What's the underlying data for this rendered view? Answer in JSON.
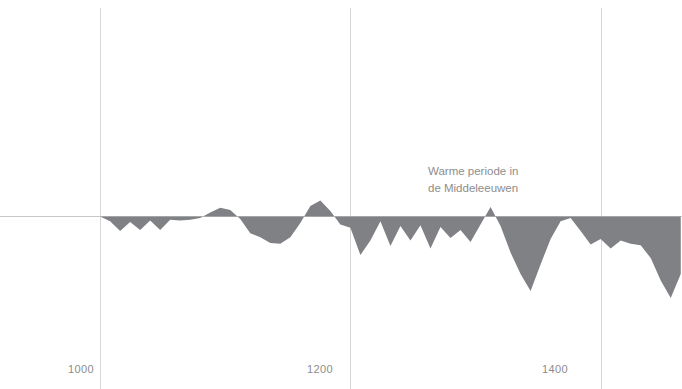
{
  "chart_data": {
    "type": "area",
    "title": "",
    "subtitle": "",
    "xlabel": "",
    "ylabel": "",
    "xlim": [
      920,
      1465
    ],
    "ylim": [
      -1.05,
      0.45
    ],
    "grid": true,
    "legend_position": "none",
    "zero_line": 0,
    "annotations": [
      {
        "id": "warm-period",
        "lines": [
          "Warme periode in",
          "de Middeleeuwen"
        ],
        "x": 1310,
        "y": 0.32
      }
    ],
    "xticks": [
      1000,
      1200,
      1400
    ],
    "xtick_labels": [
      "1000",
      "1200",
      "1400"
    ],
    "yticks": [],
    "ytick_labels": [],
    "series": [
      {
        "name": "Temperatuurafwijking",
        "fill_color": "#7f8184",
        "x": [
          1000,
          1008,
          1016,
          1024,
          1032,
          1040,
          1048,
          1056,
          1064,
          1072,
          1080,
          1088,
          1096,
          1104,
          1112,
          1120,
          1128,
          1136,
          1144,
          1152,
          1160,
          1168,
          1176,
          1184,
          1192,
          1200,
          1208,
          1216,
          1224,
          1232,
          1240,
          1248,
          1256,
          1264,
          1272,
          1280,
          1288,
          1296,
          1304,
          1312,
          1320,
          1328,
          1336,
          1344,
          1352,
          1360,
          1368,
          1376,
          1384,
          1392,
          1400,
          1408,
          1416,
          1424,
          1432,
          1440,
          1448,
          1456,
          1464
        ],
        "values": [
          0.0,
          -0.06,
          -0.18,
          -0.07,
          -0.17,
          -0.05,
          -0.17,
          -0.04,
          -0.05,
          -0.04,
          -0.02,
          0.05,
          0.11,
          0.08,
          -0.03,
          -0.21,
          -0.26,
          -0.33,
          -0.34,
          -0.26,
          -0.08,
          0.13,
          0.2,
          0.07,
          -0.1,
          -0.14,
          -0.48,
          -0.3,
          -0.06,
          -0.37,
          -0.12,
          -0.3,
          -0.11,
          -0.4,
          -0.13,
          -0.27,
          -0.17,
          -0.32,
          -0.1,
          0.12,
          -0.12,
          -0.45,
          -0.72,
          -0.93,
          -0.6,
          -0.28,
          -0.06,
          -0.02,
          -0.18,
          -0.35,
          -0.28,
          -0.4,
          -0.3,
          -0.34,
          -0.36,
          -0.52,
          -0.8,
          -1.02,
          -0.72
        ]
      }
    ]
  },
  "axis": {
    "tick_1000": "1000",
    "tick_1200": "1200",
    "tick_1400": "1400"
  },
  "annotation": {
    "line1": "Warme periode in",
    "line2": "de Middeleeuwen"
  },
  "colors": {
    "area_fill": "#7f8184",
    "gridline": "#d6d6d6",
    "zero_line": "#c9c9c9",
    "text": "#8c8c8c"
  }
}
